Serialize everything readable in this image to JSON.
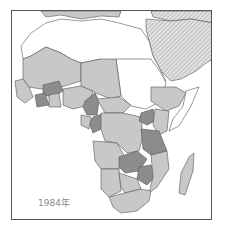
{
  "map": {
    "region": "Africa",
    "year_label": "1984年",
    "colors": {
      "background": "#ffffff",
      "light_fill": "#c8c8c8",
      "dark_fill": "#8c8c8c",
      "hatched_fill": "#d8d8d8",
      "border": "#555555"
    },
    "legend_classes": [
      "white",
      "light-gray",
      "dark-gray",
      "hatched"
    ]
  }
}
